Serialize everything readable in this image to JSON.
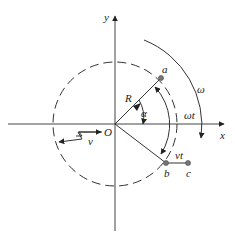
{
  "diagram": {
    "type": "kinematics-rotation-diagram",
    "colors": {
      "stroke": "#333333",
      "point_fill": "#777777",
      "background": "#ffffff"
    },
    "labels": {
      "x_axis": "x",
      "y_axis": "y",
      "origin": "O",
      "radius": "R",
      "angle": "α",
      "angular_velocity": "ω",
      "rotation_angle": "ωt",
      "velocity": "v",
      "displacement": "vt",
      "point_a": "a",
      "point_b": "b",
      "point_c": "c"
    }
  }
}
